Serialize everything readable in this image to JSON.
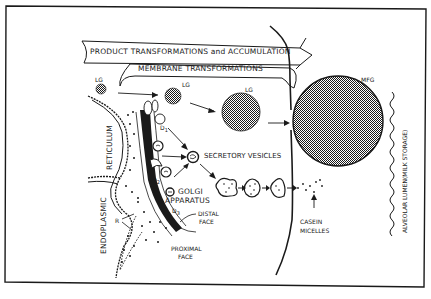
{
  "diagram": {
    "title_arrows": {
      "product": "PRODUCT TRANSFORMATIONS and ACCUMULATION",
      "membrane": "MEMBRANE TRANSFORMATIONS"
    },
    "labels": {
      "lg_1": "LG",
      "lg_2": "LG",
      "lg_3": "LG",
      "mfg": "MFG",
      "secretory_vesicles": "SECRETORY VESICLES",
      "golgi": "GOLGI",
      "apparatus": "APPARATUS",
      "distal_face_1": "DISTAL",
      "distal_face_2": "FACE",
      "proximal_face_1": "PROXIMAL",
      "proximal_face_2": "FACE",
      "casein_1": "CASEIN",
      "casein_2": "MICELLES",
      "reticulum": "RETICULUM",
      "endoplasmic": "ENDOPLASMIC",
      "r": "R",
      "d1": "D",
      "d1_sub": "1",
      "d2": "D",
      "d2_sub": "2",
      "d3": "D",
      "d3_sub": "3",
      "alveolar_lumen": "ALVEOLAR LUMEN",
      "milk_storage": "(MILK STORAGE)"
    },
    "colors": {
      "ink": "#1a1a1a",
      "paper": "#ffffff"
    }
  }
}
